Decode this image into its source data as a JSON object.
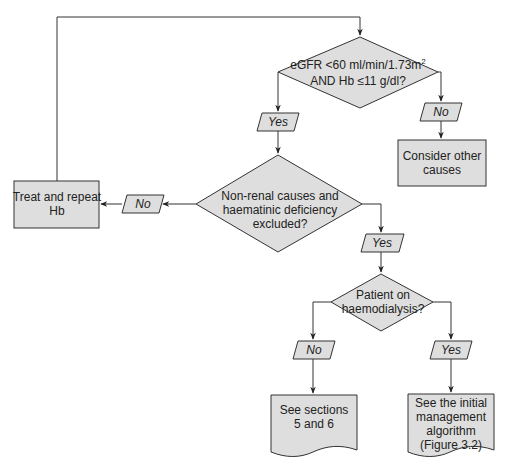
{
  "flowchart": {
    "decision_egfr": {
      "line1": "eGFR <60 ml/min/1.73m",
      "line1_sup": "2",
      "line2": "AND Hb ≤11 g/dl?"
    },
    "label_no_1": "No",
    "consider_other": {
      "line1": "Consider other",
      "line2": "causes"
    },
    "label_yes_1": "Yes",
    "decision_nonrenal": {
      "line1": "Non-renal causes and",
      "line2": "haematinic deficiency",
      "line3": "excluded?"
    },
    "label_no_2": "No",
    "treat_repeat": {
      "line1": "Treat and repeat",
      "line2": "Hb"
    },
    "label_yes_2": "Yes",
    "decision_dialysis": {
      "line1": "Patient on",
      "line2": "haemodialysis?"
    },
    "label_no_3": "No",
    "label_yes_3": "Yes",
    "doc_sections": {
      "line1": "See sections",
      "line2": "5 and 6"
    },
    "doc_algorithm": {
      "line1": "See the initial",
      "line2": "management",
      "line3": "algorithm",
      "line4": "(Figure 3.2)"
    }
  }
}
